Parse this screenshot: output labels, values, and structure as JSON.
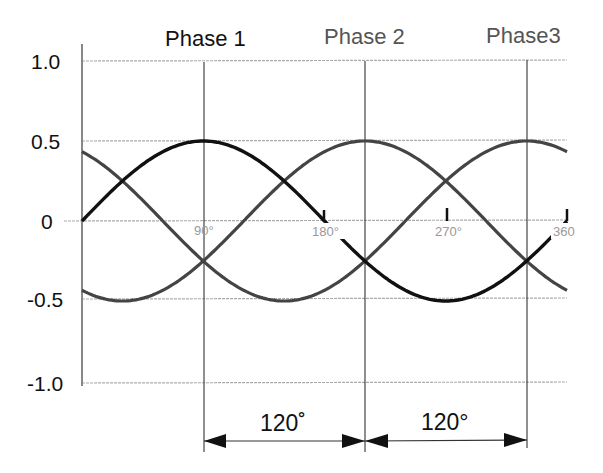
{
  "chart_data": {
    "type": "line",
    "title": "",
    "xlabel": "Phase angle (degrees)",
    "ylabel": "Amplitude",
    "xlim": [
      0,
      360
    ],
    "ylim": [
      -1.0,
      1.0
    ],
    "grid": true,
    "y_ticks": [
      1.0,
      0.5,
      0,
      -0.5,
      -1.0
    ],
    "y_tick_labels": [
      "1.0",
      "0.5",
      "0",
      "-0.5",
      "-1.0"
    ],
    "x_ticks": [
      90,
      180,
      270,
      360
    ],
    "x_tick_labels": [
      "90°",
      "180°",
      "270°",
      "360"
    ],
    "series": [
      {
        "name": "Phase 1",
        "formula": "sin(θ)",
        "phase_shift_deg": 0,
        "peak_at_deg": 90,
        "color": "#111111"
      },
      {
        "name": "Phase 2",
        "formula": "sin(θ − 120°)",
        "phase_shift_deg": 120,
        "peak_at_deg": 210,
        "color": "#444444"
      },
      {
        "name": "Phase3",
        "formula": "sin(θ − 240°)",
        "phase_shift_deg": 240,
        "peak_at_deg": 330,
        "color": "#444444"
      }
    ],
    "x": [
      0,
      30,
      60,
      90,
      120,
      150,
      180,
      210,
      240,
      270,
      300,
      330,
      360
    ],
    "values": {
      "Phase 1": [
        0,
        0.5,
        0.87,
        1.0,
        0.87,
        0.5,
        0,
        -0.5,
        -0.87,
        -1.0,
        -0.87,
        -0.5,
        0
      ],
      "Phase 2": [
        -0.87,
        -1.0,
        -0.87,
        -0.5,
        0,
        0.5,
        0.87,
        1.0,
        0.87,
        0.5,
        0,
        -0.5,
        -0.87
      ],
      "Phase3": [
        0.87,
        0.5,
        0,
        -0.5,
        -0.87,
        -1.0,
        -0.87,
        -0.5,
        0,
        0.5,
        0.87,
        1.0,
        0.87
      ]
    },
    "annotations": [
      {
        "type": "dimension",
        "from_deg": 90,
        "to_deg": 210,
        "label": "120˚"
      },
      {
        "type": "dimension",
        "from_deg": 210,
        "to_deg": 330,
        "label": "120°"
      }
    ],
    "legend_position": "top (labels above peaks)"
  },
  "labels": {
    "phase1": "Phase 1",
    "phase2": "Phase 2",
    "phase3": "Phase3",
    "y": [
      "1.0",
      "0.5",
      "0",
      "-0.5",
      "-1.0"
    ],
    "deg90": "90°",
    "deg180": "180°",
    "deg270": "270°",
    "deg360": "360",
    "dim1": "120˚",
    "dim2": "120°"
  },
  "colors": {
    "phase1": "#111111",
    "phase2": "#444444",
    "phase3": "#444444",
    "grid": "#aaaaaa",
    "tick_label": "#999999"
  }
}
